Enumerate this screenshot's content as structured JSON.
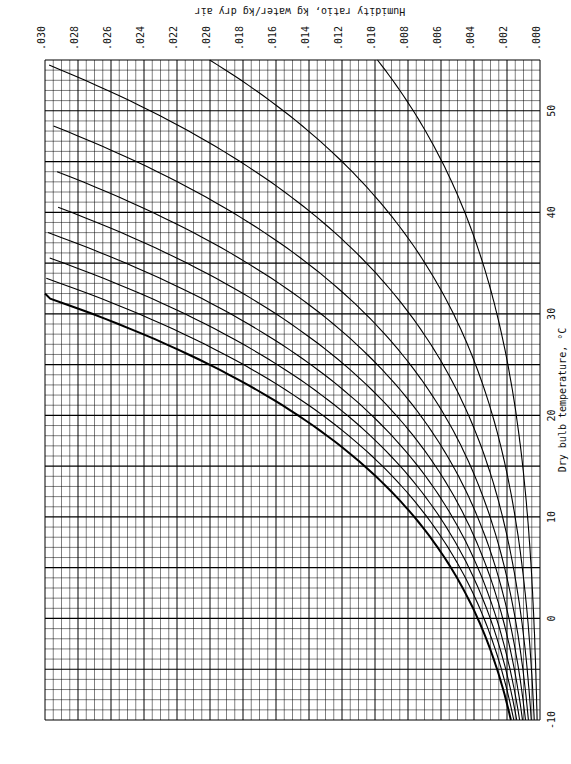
{
  "chart_data": {
    "type": "psychrometric",
    "orientation": "rotated 90° clockwise: dry bulb axis on right edge (increasing upward), humidity ratio axis on top edge (increasing leftward)",
    "provenance": {
      "read_from_image": [
        "axis ranges",
        "tick labels",
        "curve labels",
        "axis titles"
      ],
      "modeled_not_measured": [
        "saturation curve shape",
        "RH curve shapes",
        "specific volume line positions",
        "enthalpy line positions",
        "wet bulb line positions"
      ],
      "model_note": "Curves drawn from a simplified psychrometric formula (Magnus-type vapor pressure, Ws = 0.622*Pws/(P-Pws), P=101.325 kPa) chosen to roughly match the visible curves; not digitized point-by-point from the image."
    },
    "x_axis": {
      "label": "Dry bulb temperature, °C",
      "ticks": [
        -10,
        0,
        10,
        20,
        30,
        40,
        50
      ],
      "range": [
        -10,
        55
      ],
      "range_source": "read from image (upper bound approximate)"
    },
    "y_axis": {
      "label": "Humidity ratio, kg water/kg dry air",
      "ticks": [
        ".000",
        ".002",
        ".004",
        ".006",
        ".008",
        ".010",
        ".012",
        ".014",
        ".016",
        ".018",
        ".020",
        ".022",
        ".024",
        ".026",
        ".028",
        ".030"
      ],
      "range": [
        0,
        0.03
      ],
      "range_source": "read from image"
    },
    "enthalpy_scale": {
      "label": "Specific enthalpy of moist air , kJ/kg dry air",
      "ticks": [
        0,
        10,
        20,
        30,
        40,
        50,
        60,
        70,
        80,
        90,
        100
      ]
    },
    "wet_bulb": {
      "label": "Wet bulb or saturation temperature, °C",
      "ticks": [
        0,
        10,
        20,
        30
      ]
    },
    "relative_humidity": {
      "label": "Relative humidity",
      "curves": [
        "10%",
        "20%",
        "30%",
        "40%",
        "50%",
        "60%",
        "70%",
        "80%",
        "90%"
      ],
      "curve_values_modeled": true
    },
    "specific_volume": {
      "label": "Specific volume, m³/kg dry air",
      "lines": [
        "0.80",
        "0.85",
        "0.90",
        "0.95"
      ],
      "line_positions_modeled": true
    },
    "grid": true
  },
  "labels": {
    "top_title": "Humidity ratio,  kg water/kg dry air",
    "right_title": "Dry bulb temperature, °C",
    "enthalpy_title": "Specific enthalpy of moist air , kJ/kg dry air",
    "wetbulb_title": "Wet bulb or saturation temperature, °C",
    "rh_title": "10% Relative humidity",
    "sv_title": "Specific volume, m³/kg dry air"
  }
}
